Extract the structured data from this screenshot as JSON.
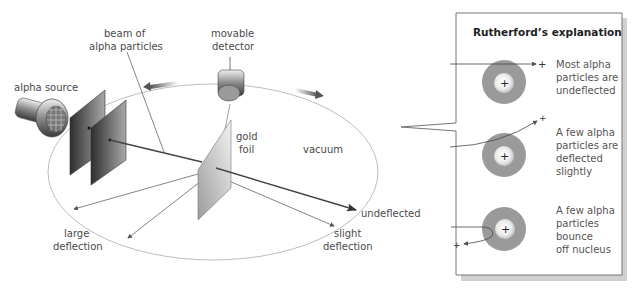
{
  "apparatus": {
    "labels": {
      "alpha_source": "alpha source",
      "beam_line1": "beam of",
      "beam_line2": "alpha particles",
      "detector_line1": "movable",
      "detector_line2": "detector",
      "gold_line1": "gold",
      "gold_line2": "foil",
      "vacuum": "vacuum",
      "undeflected": "undeflected",
      "large_line1": "large",
      "large_line2": "deflection",
      "slight_line1": "slight",
      "slight_line2": "deflection"
    },
    "icons": [
      "alpha-source-icon",
      "collimator-plate-icon",
      "movable-detector-icon",
      "gold-foil-icon",
      "rotation-arrow-icon"
    ]
  },
  "explanation": {
    "title": "Rutherford’s explanation",
    "cases": [
      {
        "lines": [
          "Most alpha",
          "particles are",
          "undeflected"
        ],
        "charge": "+",
        "nucleus_charge": "+"
      },
      {
        "lines": [
          "A few alpha",
          "particles are",
          "deflected",
          "slightly"
        ],
        "charge": "+",
        "nucleus_charge": "+"
      },
      {
        "lines": [
          "A few alpha",
          "particles",
          "bounce",
          "off nucleus"
        ],
        "charge": "+",
        "nucleus_charge": "+"
      }
    ]
  },
  "colors": {
    "atom_outer": "#9a9a9a",
    "nucleus": "#f2f2f2",
    "line": "#555555",
    "box_border": "#666666",
    "shadow": "#c8c8c8"
  }
}
